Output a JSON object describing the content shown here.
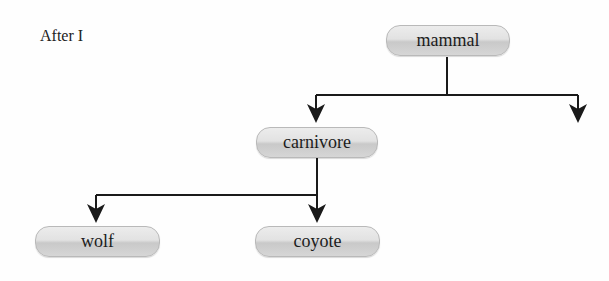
{
  "caption": "After I",
  "nodes": {
    "mammal": "mammal",
    "carnivore": "carnivore",
    "wolf": "wolf",
    "coyote": "coyote"
  },
  "edges": [
    {
      "from": "mammal",
      "to": "carnivore"
    },
    {
      "from": "mammal",
      "to": "(unlabeled)"
    },
    {
      "from": "carnivore",
      "to": "wolf"
    },
    {
      "from": "carnivore",
      "to": "coyote"
    }
  ],
  "colors": {
    "line": "#1a1a1a",
    "node_border": "#b9b9b9",
    "node_fill": "#dcdcdc"
  }
}
